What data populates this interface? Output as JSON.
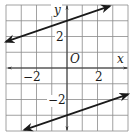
{
  "chart_data": {
    "type": "line",
    "title": "",
    "xlabel": "x",
    "ylabel": "y",
    "origin_label": "O",
    "xlim": [
      -4,
      4
    ],
    "ylim": [
      -4,
      4
    ],
    "grid": true,
    "grid_step": 1,
    "x_tick_labels": [
      {
        "value": -2,
        "label": "−2"
      },
      {
        "value": 2,
        "label": "2"
      }
    ],
    "y_tick_labels": [
      {
        "value": 2,
        "label": "2"
      },
      {
        "value": -2,
        "label": "−2"
      }
    ],
    "series": [
      {
        "name": "upper line",
        "equation": "y = x/3 + 3",
        "slope": 0.3333,
        "intercept": 3,
        "x": [
          -4,
          2.8
        ],
        "y": [
          1.67,
          3.93
        ],
        "arrows": "both"
      },
      {
        "name": "lower line",
        "equation": "y = x/3 - 3",
        "slope": 0.3333,
        "intercept": -3,
        "x": [
          -2.8,
          4
        ],
        "y": [
          -3.93,
          -1.67
        ],
        "arrows": "both"
      }
    ],
    "colors": {
      "grid": "#8a8a8a",
      "axis": "#333333",
      "line": "#1a1a1a"
    }
  }
}
